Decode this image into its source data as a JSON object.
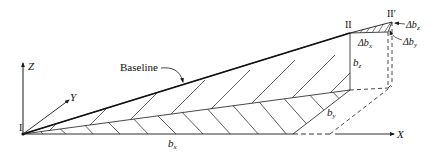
{
  "diagram": {
    "type": "3d-baseline-geometry",
    "labels": {
      "point_start": "I",
      "point_end": "II",
      "point_end_prime": "II′",
      "baseline": "Baseline",
      "axis_x": "X",
      "axis_y": "Y",
      "axis_z": "Z",
      "b_x_base": "b",
      "b_x_sub": "x",
      "b_y_base": "b",
      "b_y_sub": "y",
      "b_z_base": "b",
      "b_z_sub": "z",
      "delta_bx_base": "Δb",
      "delta_bx_sub": "x",
      "delta_by_base": "Δb",
      "delta_by_sub": "y",
      "delta_bz_base": "Δb",
      "delta_bz_sub": "z"
    },
    "colors": {
      "stroke": "#1a1a1a",
      "background": "#ffffff"
    }
  }
}
